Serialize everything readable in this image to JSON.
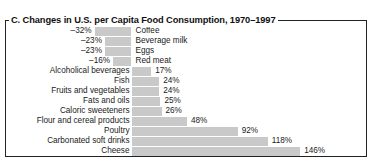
{
  "figure": {
    "panel_letter": "C.",
    "title": "C. Changes in U.S. per Capita Food Consumption, 1970–1997"
  },
  "colors": {
    "bar": "#c9c9c9",
    "frame": "#222222",
    "text": "#1a1a1a"
  },
  "chart_data": {
    "type": "bar",
    "orientation": "horizontal",
    "title": "C. Changes in U.S. per Capita Food Consumption, 1970–1997",
    "xlabel": "",
    "ylabel": "",
    "grid": false,
    "legend": false,
    "zero_baseline": true,
    "unit": "%",
    "xlim": [
      -32,
      146
    ],
    "categories": [
      "Coffee",
      "Beverage milk",
      "Eggs",
      "Red meat",
      "Alcoholical beverages",
      "Fish",
      "Fruits and vegetables",
      "Fats and oils",
      "Caloric sweeteners",
      "Flour and cereal products",
      "Poultry",
      "Carbonated soft drinks",
      "Cheese"
    ],
    "values": [
      -32,
      -23,
      -23,
      -16,
      17,
      24,
      24,
      25,
      26,
      48,
      92,
      118,
      146
    ],
    "value_labels": [
      "–32%",
      "–23%",
      "–23%",
      "–16%",
      "17%",
      "24%",
      "24%",
      "25%",
      "26%",
      "48%",
      "92%",
      "118%",
      "146%"
    ]
  }
}
